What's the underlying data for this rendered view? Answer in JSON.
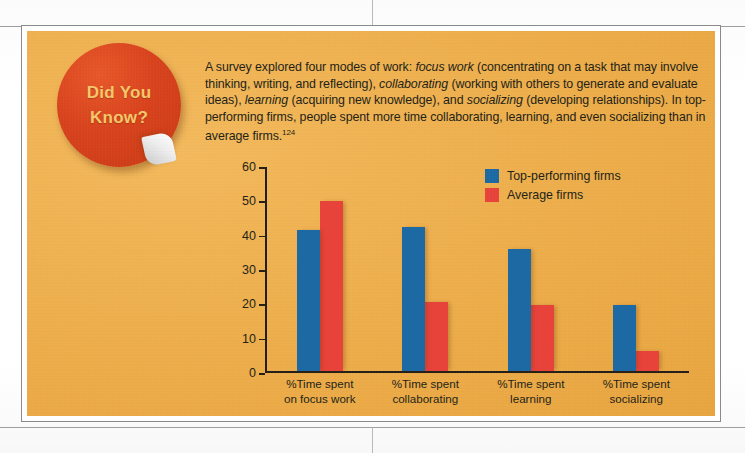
{
  "page": {
    "cropped_header_text": "",
    "callout_background_color": "#edad4a",
    "border_color": "#8a8a8a"
  },
  "sticker": {
    "line1": "Did You",
    "line2": "Know?",
    "circle_color": "#d8431d",
    "text_color": "#f6c86a"
  },
  "intro": {
    "part1": "A survey explored four modes of work: ",
    "em1": "focus work",
    "part2": " (concentrating on a task that may involve thinking, writing, and reflecting), ",
    "em2": "collaborating",
    "part3": " (working with others to generate and evaluate ideas), ",
    "em3": "learning",
    "part4": " (acquiring new knowledge), and ",
    "em4": "socializing",
    "part5": " (developing relationships). In top-performing firms, people spent more time collaborating, learning, and even socializing than in average firms.",
    "footnote": "124"
  },
  "chart_data": {
    "type": "bar",
    "title": "",
    "xlabel": "",
    "ylabel": "",
    "ylim": [
      0,
      60
    ],
    "yticks": [
      0,
      10,
      20,
      30,
      40,
      50,
      60
    ],
    "grid": false,
    "legend_position": "top-right",
    "categories": [
      "%Time spent on focus work",
      "%Time spent collaborating",
      "%Time spent learning",
      "%Time spent socializing"
    ],
    "category_lines": [
      [
        "%Time spent",
        "on focus work"
      ],
      [
        "%Time spent",
        "collaborating"
      ],
      [
        "%Time spent",
        "learning"
      ],
      [
        "%Time spent",
        "socializing"
      ]
    ],
    "series": [
      {
        "name": "Top-performing firms",
        "color": "#1d69a3",
        "values": [
          41.5,
          42.5,
          36,
          19.5
        ]
      },
      {
        "name": "Average firms",
        "color": "#e8433b",
        "values": [
          50,
          20.2,
          19.3,
          6
        ]
      }
    ]
  }
}
